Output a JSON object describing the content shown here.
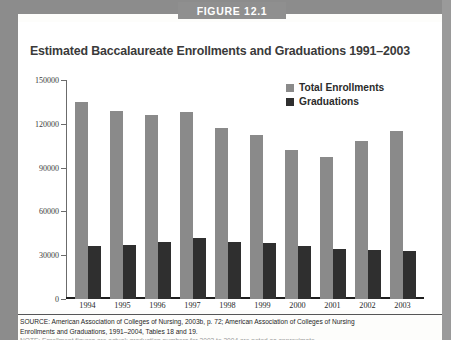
{
  "figure": {
    "banner_label": "FIGURE 12.1",
    "title": "Estimated Baccalaureate Enrollments and Graduations 1991–2003"
  },
  "legend": {
    "position": "top-right",
    "items": [
      {
        "label": "Total Enrollments",
        "color": "#8a8a8a",
        "swatch_name": "legend-swatch-total-enrollments"
      },
      {
        "label": "Graduations",
        "color": "#2f2f2f",
        "swatch_name": "legend-swatch-graduations"
      }
    ]
  },
  "axis": {
    "y_ticks": [
      "0",
      "30000",
      "60000",
      "90000",
      "120000",
      "150000"
    ],
    "x_ticks": [
      "1994",
      "1995",
      "1996",
      "1997",
      "1998",
      "1999",
      "2000",
      "2001",
      "2002",
      "2003"
    ]
  },
  "source_note": {
    "line1": "SOURCE: American Association of Colleges of Nursing, 2003b, p. 72; American Association of Colleges of Nursing",
    "line2": "Enrollments and Graduations, 1991–2004, Tables 18 and 19.",
    "line3": "NOTE: Enrollment figures are actual; graduation numbers for 2003 to 2004 are noted as approximate."
  },
  "chart_data": {
    "type": "bar",
    "title": "Estimated Baccalaureate Enrollments and Graduations 1991–2003",
    "xlabel": "",
    "ylabel": "",
    "ylim": [
      0,
      150000
    ],
    "ytick_values": [
      0,
      30000,
      60000,
      90000,
      120000,
      150000
    ],
    "grid": false,
    "legend_position": "top-right",
    "categories": [
      "1994",
      "1995",
      "1996",
      "1997",
      "1998",
      "1999",
      "2000",
      "2001",
      "2002",
      "2003"
    ],
    "series": [
      {
        "name": "Total Enrollments",
        "color": "#8a8a8a",
        "values": [
          135000,
          128500,
          126000,
          128000,
          117000,
          112000,
          102000,
          97000,
          108000,
          115000
        ]
      },
      {
        "name": "Graduations",
        "color": "#2f2f2f",
        "values": [
          36000,
          37000,
          39000,
          42000,
          39000,
          38500,
          36000,
          34500,
          33500,
          33000
        ]
      }
    ]
  }
}
